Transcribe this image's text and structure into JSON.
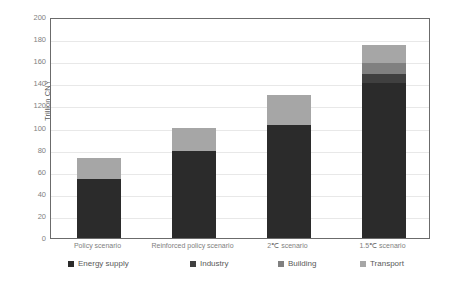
{
  "chart_data": {
    "type": "bar",
    "subtype": "stacked",
    "title": "",
    "subtitle": "",
    "xlabel": "",
    "ylabel": "Trillion CNY",
    "ylim": [
      0,
      200
    ],
    "yticks": [
      0,
      20,
      40,
      60,
      80,
      100,
      120,
      140,
      160,
      180,
      200
    ],
    "ytick_labels": [
      "0",
      "20",
      "40",
      "60",
      "80",
      "100",
      "120",
      "140",
      "160",
      "180",
      "200"
    ],
    "grid": true,
    "grid_axis": "y",
    "legend_position": "bottom",
    "categories": [
      "Policy scenario",
      "Reinforced policy scenario",
      "2℃ scenario",
      "1.5℃ scenario"
    ],
    "series": [
      {
        "name": "Energy supply",
        "color": "#2b2b2b",
        "values": [
          53,
          79,
          102,
          140
        ]
      },
      {
        "name": "Industry",
        "color": "#404040",
        "values": [
          0,
          0,
          0,
          8
        ]
      },
      {
        "name": "Building",
        "color": "#808080",
        "values": [
          0,
          0,
          0,
          10
        ]
      },
      {
        "name": "Transport",
        "color": "#a6a6a6",
        "values": [
          19,
          21,
          27,
          17
        ]
      }
    ],
    "totals": [
      72,
      100,
      129,
      175
    ],
    "axis_color": "#6b6b6b",
    "gridline_color": "#e8e8e8",
    "tick_label_color": "#808080",
    "background": "#ffffff"
  },
  "legend": {
    "items": [
      {
        "label": "Energy supply",
        "color": "#2b2b2b"
      },
      {
        "label": "Industry",
        "color": "#404040"
      },
      {
        "label": "Building",
        "color": "#808080"
      },
      {
        "label": "Transport",
        "color": "#a6a6a6"
      }
    ]
  }
}
